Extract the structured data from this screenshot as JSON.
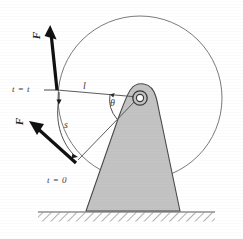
{
  "figure": {
    "type": "mechanics-diagram",
    "colors": {
      "body_fill": "#c3c3c3",
      "body_stroke": "#4a4a4a",
      "circle_stroke": "#6b6b6b",
      "line_stroke": "#4a4a4a",
      "arrow_fill": "#111111",
      "ground_stroke": "#5a5a5a",
      "hatch_stroke": "#6e6e6e",
      "background": "#ffffff"
    },
    "labels": {
      "force_upper": "F",
      "force_lower": "F",
      "time_upper": "t = t",
      "time_lower": "t = 0",
      "radius": "l",
      "arc": "s",
      "angle": "θ"
    },
    "geometry": {
      "circle_center_x": 140,
      "circle_center_y": 98,
      "circle_radius": 82,
      "pivot_x": 140,
      "pivot_y": 98,
      "pivot_radius_outer": 7,
      "pivot_radius_inner": 4,
      "ground_y": 212,
      "ground_left_x": 38,
      "ground_right_x": 215,
      "base_left_x": 86,
      "base_right_x": 180,
      "point_t_t_x": 57,
      "point_t_t_y": 90,
      "point_t_0_x": 78,
      "point_t_0_y": 159
    }
  }
}
